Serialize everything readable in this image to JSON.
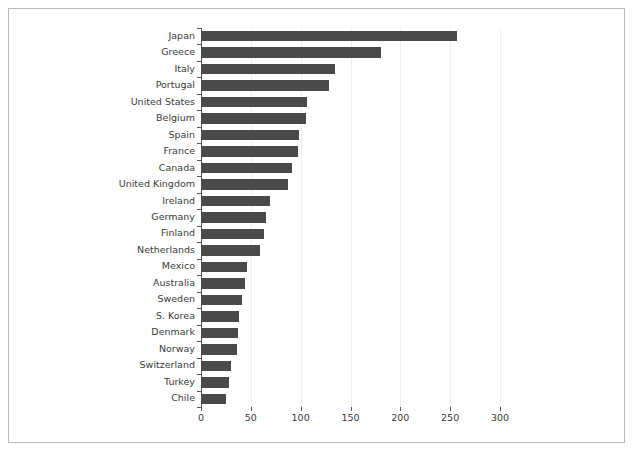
{
  "figure": {
    "background_color": "#ffffff",
    "frame_color": "#b9b9b9",
    "bar_color": "#4a4a4a",
    "grid_color": "#eeeeee",
    "axis_color": "#555555",
    "text_color": "#3a3a3a"
  },
  "chart_data": {
    "type": "bar",
    "orientation": "horizontal",
    "title": "",
    "subtitle": "",
    "xlabel": "",
    "ylabel": "",
    "xlim": [
      0,
      300
    ],
    "ylim": null,
    "grid": true,
    "grid_axis": "x",
    "legend": false,
    "legend_position": "none",
    "categories": [
      "Japan",
      "Greece",
      "Italy",
      "Portugal",
      "United States",
      "Belgium",
      "Spain",
      "France",
      "Canada",
      "United Kingdom",
      "Ireland",
      "Germany",
      "Finland",
      "Netherlands",
      "Mexico",
      "Australia",
      "Sweden",
      "S. Korea",
      "Denmark",
      "Norway",
      "Switzerland",
      "Turkey",
      "Chile"
    ],
    "values": [
      257,
      181,
      134,
      128,
      106,
      105,
      98,
      97,
      91,
      87,
      69,
      65,
      63,
      59,
      46,
      44,
      41,
      38,
      37,
      36,
      30,
      28,
      25
    ],
    "xticks": [
      0,
      50,
      100,
      150,
      200,
      250,
      300
    ],
    "xticklabels": [
      "0",
      "50",
      "100",
      "150",
      "200",
      "250",
      "300"
    ],
    "annotations": []
  }
}
